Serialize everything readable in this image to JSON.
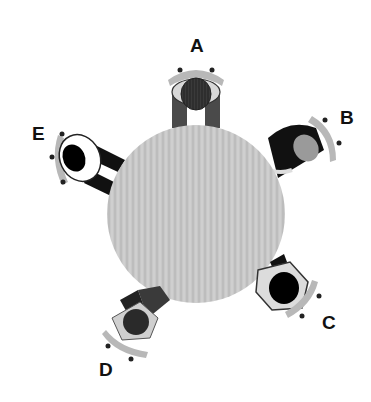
{
  "diagram": {
    "table": {
      "shape": "circle",
      "cx": 196,
      "cy": 214,
      "r": 89,
      "fill": "#c9c9c9"
    },
    "seats": [
      {
        "id": "A",
        "label": "A",
        "label_x": 190,
        "label_y": 36,
        "angle": -90,
        "person_shirt": "#555555",
        "head": "#3a3a3a"
      },
      {
        "id": "B",
        "label": "B",
        "label_x": 340,
        "label_y": 108,
        "angle": -35,
        "person_shirt": "#111111",
        "head": "#9a9a9a"
      },
      {
        "id": "C",
        "label": "C",
        "label_x": 322,
        "label_y": 313,
        "angle": 40,
        "person_shirt": "#111111",
        "head": "#000000"
      },
      {
        "id": "D",
        "label": "D",
        "label_x": 99,
        "label_y": 360,
        "angle": 125,
        "person_shirt": "#333333",
        "head": "#2a2a2a"
      },
      {
        "id": "E",
        "label": "E",
        "label_x": 32,
        "label_y": 124,
        "angle": -155,
        "person_shirt": "#ffffff",
        "head": "#000000"
      }
    ]
  }
}
